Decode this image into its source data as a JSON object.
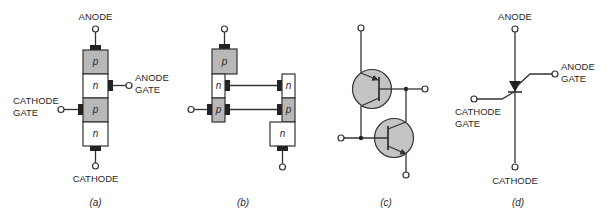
{
  "figure": {
    "colors": {
      "p_layer": "#b8b8b8",
      "n_layer": "#ffffff",
      "transistor_fill": "#c4c4c4",
      "line": "#333333",
      "contact": "#222222"
    }
  },
  "panel_a": {
    "caption": "(a)",
    "anode": "ANODE",
    "cathode": "CATHODE",
    "anode_gate": [
      "ANODE",
      "GATE"
    ],
    "cathode_gate": [
      "CATHODE",
      "GATE"
    ],
    "layers": [
      "p",
      "n",
      "p",
      "n"
    ]
  },
  "panel_b": {
    "caption": "(b)",
    "left_layers": [
      "p",
      "n",
      "p"
    ],
    "right_layers": [
      "n",
      "p",
      "n"
    ]
  },
  "panel_c": {
    "caption": "(c)"
  },
  "panel_d": {
    "caption": "(d)",
    "anode": "ANODE",
    "cathode": "CATHODE",
    "anode_gate": [
      "ANODE",
      "GATE"
    ],
    "cathode_gate": [
      "CATHODE",
      "GATE"
    ]
  }
}
